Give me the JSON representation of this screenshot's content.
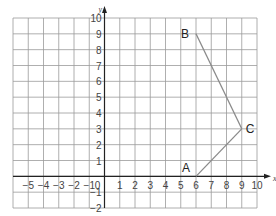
{
  "chart_data": {
    "type": "line",
    "title": "",
    "xlabel": "x",
    "ylabel": "y",
    "xlim": [
      -6,
      10
    ],
    "ylim": [
      -2,
      10
    ],
    "grid": true,
    "x_ticks": [
      "-5",
      "-4",
      "-3",
      "-2",
      "-1",
      "0",
      "1",
      "2",
      "3",
      "4",
      "5",
      "6",
      "7",
      "8",
      "9",
      "10"
    ],
    "y_ticks": [
      "-2",
      "-1",
      "1",
      "2",
      "3",
      "4",
      "5",
      "6",
      "7",
      "8",
      "9",
      "10"
    ],
    "points": [
      {
        "label": "A",
        "x": 6,
        "y": 0
      },
      {
        "label": "B",
        "x": 6,
        "y": 9
      },
      {
        "label": "C",
        "x": 9,
        "y": 3
      }
    ],
    "segments": [
      [
        "B",
        "C"
      ],
      [
        "C",
        "A"
      ]
    ],
    "colors": {
      "grid": "#9a9a9a",
      "axis": "#222222",
      "line": "#8a8a8a"
    }
  }
}
